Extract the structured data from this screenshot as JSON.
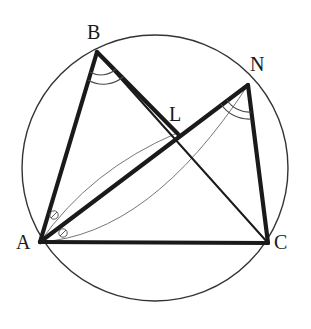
{
  "figure": {
    "width": 311,
    "height": 329,
    "background_color": "#ffffff",
    "stroke_color": "#1a1a1a",
    "thin_stroke_color": "#555555",
    "circle_stroke_color": "#333333"
  },
  "circle": {
    "name": "circumcircle",
    "center_x": 155,
    "center_y": 168,
    "radius": 133,
    "stroke_width": 1.4
  },
  "points": {
    "A": {
      "label": "A",
      "x": 40,
      "y": 242,
      "label_x": 16,
      "label_y": 232
    },
    "B": {
      "label": "B",
      "x": 97,
      "y": 52,
      "label_x": 87,
      "label_y": 22
    },
    "N": {
      "label": "N",
      "x": 248,
      "y": 85,
      "label_x": 250,
      "label_y": 54
    },
    "C": {
      "label": "C",
      "x": 268,
      "y": 243,
      "label_x": 274,
      "label_y": 232
    },
    "L": {
      "label": "L",
      "x": 177,
      "y": 133,
      "label_x": 169,
      "label_y": 104
    }
  },
  "segments": [
    {
      "name": "segment-AB",
      "from": "A",
      "to": "B",
      "x1": 40,
      "y1": 242,
      "x2": 97,
      "y2": 52,
      "width": 4.2,
      "style": "thick"
    },
    {
      "name": "segment-BC",
      "from": "B",
      "to": "C",
      "x1": 97,
      "y1": 52,
      "x2": 268,
      "y2": 243,
      "width": 2.0,
      "style": "medium"
    },
    {
      "name": "segment-BL",
      "from": "B",
      "to": "L",
      "x1": 97,
      "y1": 52,
      "x2": 177,
      "y2": 133,
      "width": 4.2,
      "style": "thick"
    },
    {
      "name": "segment-AN",
      "from": "A",
      "to": "N",
      "x1": 40,
      "y1": 242,
      "x2": 248,
      "y2": 85,
      "width": 4.2,
      "style": "thick"
    },
    {
      "name": "segment-NC",
      "from": "N",
      "to": "C",
      "x1": 248,
      "y1": 85,
      "x2": 268,
      "y2": 243,
      "width": 4.2,
      "style": "thick"
    },
    {
      "name": "segment-AC",
      "from": "A",
      "to": "C",
      "x1": 40,
      "y1": 242,
      "x2": 268,
      "y2": 243,
      "width": 4.0,
      "style": "thick"
    }
  ],
  "arcs": [
    {
      "name": "arc-A-to-L",
      "description": "thin curved arc from A to L",
      "path": "M 40 242 Q 90 170 177 133",
      "width": 0.9
    },
    {
      "name": "arc-A-to-N",
      "description": "thin curved arc from A to N",
      "path": "M 40 242 Q 150 235 248 85",
      "width": 0.9
    }
  ],
  "angle_marks": [
    {
      "name": "angle-mark-B-outer",
      "at": "B",
      "description": "double arc at vertex B for angle ABL",
      "path": "M 88 80 A 30 30 0 0 0 124 76",
      "width": 1.1
    },
    {
      "name": "angle-mark-B-inner",
      "at": "B",
      "description": "double arc at vertex B for angle ABL",
      "path": "M 90 72 A 22 22 0 0 0 116 69",
      "width": 1.1
    },
    {
      "name": "angle-mark-N-outer",
      "at": "N",
      "description": "double arc at vertex N for angle LNC",
      "path": "M 221 104 A 33 33 0 0 0 251 119",
      "width": 1.1
    },
    {
      "name": "angle-mark-N-inner",
      "at": "N",
      "description": "double arc at vertex N for angle LNC",
      "path": "M 227 100 A 26 26 0 0 0 251 112",
      "width": 1.1
    },
    {
      "name": "angle-mark-A-upper-circle",
      "at": "A",
      "description": "small circle marker on upper angle at A",
      "cx": 54,
      "cy": 215,
      "r": 4.2,
      "width": 0.9
    },
    {
      "name": "angle-mark-A-lower-circle",
      "at": "A",
      "description": "small circle marker on lower angle at A",
      "cx": 63,
      "cy": 233,
      "r": 4.2,
      "width": 0.9
    },
    {
      "name": "angle-mark-A-upper-tick",
      "at": "A",
      "description": "tick through upper circle marker at A",
      "path": "M 51 218 L 57 212",
      "width": 0.9
    },
    {
      "name": "angle-mark-A-lower-tick",
      "at": "A",
      "description": "tick through lower circle marker at A",
      "path": "M 60 236 L 66 230",
      "width": 0.9
    }
  ]
}
